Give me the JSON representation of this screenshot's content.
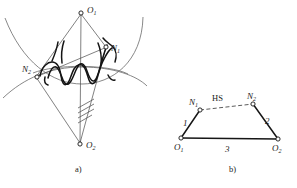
{
  "figure": {
    "captions": [
      {
        "id": "caption-a",
        "text": "a)"
      },
      {
        "id": "caption-b",
        "text": "b)"
      }
    ]
  },
  "panel_a": {
    "name": "gear-mesh-geometry",
    "points": [
      {
        "key": "O1",
        "base": "O",
        "sub": "1",
        "x": 81,
        "y": 13
      },
      {
        "key": "N1",
        "base": "N",
        "sub": "1",
        "x": 106,
        "y": 47
      },
      {
        "key": "N2",
        "base": "N",
        "sub": "2",
        "x": 37,
        "y": 77
      },
      {
        "key": "O2",
        "base": "O",
        "sub": "2",
        "x": 80,
        "y": 144
      }
    ],
    "labels": [
      {
        "key": "O1-label",
        "base": "O",
        "sub": "1",
        "x": 87,
        "y": 13
      },
      {
        "key": "N1-label",
        "base": "N",
        "sub": "1",
        "x": 111,
        "y": 50
      },
      {
        "key": "N2-label",
        "base": "N",
        "sub": "2",
        "x": 23,
        "y": 71
      },
      {
        "key": "O2-label",
        "base": "O",
        "sub": "2",
        "x": 86,
        "y": 147
      }
    ],
    "hatching": {
      "name": "ground-hatching",
      "count": 4
    }
  },
  "panel_b": {
    "name": "equivalent-linkage",
    "points": [
      {
        "key": "N1",
        "base": "N",
        "sub": "1",
        "x": 200,
        "y": 110
      },
      {
        "key": "N2",
        "base": "N",
        "sub": "2",
        "x": 253,
        "y": 104
      },
      {
        "key": "O1",
        "base": "O",
        "sub": "1",
        "x": 181,
        "y": 138
      },
      {
        "key": "O2",
        "base": "O",
        "sub": "2",
        "x": 278,
        "y": 139
      }
    ],
    "labels": [
      {
        "key": "N1-label",
        "base": "N",
        "sub": "1",
        "x": 189,
        "y": 103
      },
      {
        "key": "N2-label",
        "base": "N",
        "sub": "2",
        "x": 248,
        "y": 97
      },
      {
        "key": "O1-label",
        "base": "O",
        "sub": "1",
        "x": 175,
        "y": 149
      },
      {
        "key": "O2-label",
        "base": "O",
        "sub": "2",
        "x": 274,
        "y": 150
      }
    ],
    "link_labels": [
      {
        "key": "link-1",
        "text": "1",
        "x": 184,
        "y": 124
      },
      {
        "key": "link-2",
        "text": "2",
        "x": 266,
        "y": 122
      },
      {
        "key": "link-3",
        "text": "3",
        "x": 226,
        "y": 150
      }
    ],
    "coupler_label": {
      "key": "HS",
      "text": "HS",
      "x": 220,
      "y": 100
    }
  },
  "colors": {
    "ink": "#141414",
    "thin": "#4a4a4a",
    "arc": "#6a6a6a",
    "paper": "#ffffff"
  }
}
